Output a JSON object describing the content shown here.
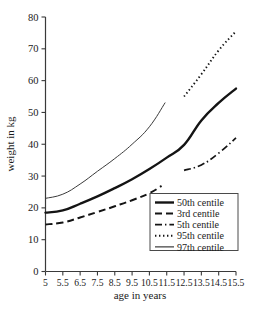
{
  "chart_data": {
    "type": "line",
    "title": "",
    "xlabel": "age in years",
    "ylabel": "weight in kg",
    "xlim": [
      5,
      15.5
    ],
    "ylim": [
      0,
      80
    ],
    "grid": false,
    "legend_position": "inside-lower-right",
    "xticks": [
      "5",
      "5.5",
      "6.5",
      "7.5",
      "8.5",
      "9.5",
      "10.5",
      "11.5",
      "12.5",
      "13.5",
      "14.5",
      "15.5"
    ],
    "xtick_values": [
      5,
      5.5,
      6.5,
      7.5,
      8.5,
      9.5,
      10.5,
      11.5,
      12.5,
      13.5,
      14.5,
      15.5
    ],
    "yticks": [
      "0",
      "10",
      "20",
      "30",
      "40",
      "50",
      "60",
      "70",
      "80"
    ],
    "ytick_values": [
      0,
      10,
      20,
      30,
      40,
      50,
      60,
      70,
      80
    ],
    "series": [
      {
        "name": "50th centile",
        "style": "solid-thick",
        "color": "#141414",
        "x": [
          5,
          5.5,
          6.5,
          7.5,
          8.5,
          9.5,
          10.5,
          11.5,
          12.5,
          13.5,
          14.5,
          15.5
        ],
        "y": [
          18.5,
          19.2,
          21.3,
          23.6,
          26.2,
          29.0,
          32.2,
          35.8,
          39.8,
          47.5,
          53.0,
          57.5
        ]
      },
      {
        "name": "3rd centile",
        "style": "dashed",
        "color": "#141414",
        "x": [
          5,
          5.5,
          6.5,
          7.5,
          8.5,
          9.5,
          10.5,
          11.2
        ],
        "y": [
          14.8,
          15.4,
          17.0,
          18.7,
          20.5,
          22.4,
          24.6,
          26.9
        ]
      },
      {
        "name": "5th centile",
        "style": "dash-dot",
        "color": "#141414",
        "x": [
          12.5,
          13.5,
          14.5,
          15.5
        ],
        "y": [
          31.8,
          33.5,
          37.2,
          42.0
        ]
      },
      {
        "name": "95th centile",
        "style": "dotted",
        "color": "#141414",
        "x": [
          12.5,
          13.5,
          14.5,
          15.5
        ],
        "y": [
          55.0,
          62.0,
          69.5,
          75.5
        ]
      },
      {
        "name": "97th centile",
        "style": "solid-thin",
        "color": "#3a3a3a",
        "x": [
          5,
          5.5,
          6.5,
          7.5,
          8.5,
          9.5,
          10.5,
          11.4
        ],
        "y": [
          23.0,
          24.3,
          27.5,
          31.5,
          35.5,
          40.0,
          45.5,
          53.0
        ]
      }
    ],
    "legend_entries": [
      {
        "label": "50th centile",
        "style": "solid-thick"
      },
      {
        "label": "3rd centile",
        "style": "dashed"
      },
      {
        "label": "5th centile",
        "style": "dash-dot"
      },
      {
        "label": "95th centile",
        "style": "dotted"
      },
      {
        "label": "97th centile",
        "style": "solid-thin"
      }
    ]
  }
}
